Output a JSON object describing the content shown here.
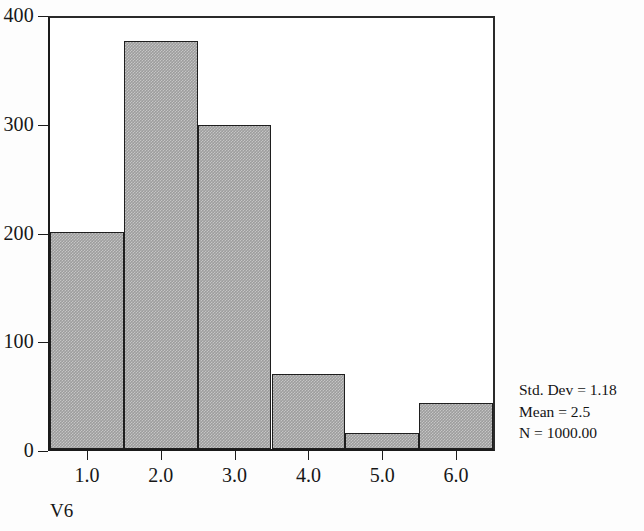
{
  "chart_data": {
    "type": "bar",
    "title": "",
    "subtitle": "",
    "xlabel": "V6",
    "ylabel": "",
    "categories": [
      "1.0",
      "2.0",
      "3.0",
      "4.0",
      "5.0",
      "6.0"
    ],
    "values": [
      200,
      375,
      298,
      69,
      15,
      42
    ],
    "x_tick_labels": [
      "1.0",
      "2.0",
      "3.0",
      "4.0",
      "5.0",
      "6.0"
    ],
    "y_tick_labels": [
      "0",
      "100",
      "200",
      "300",
      "400"
    ],
    "y_ticks": [
      0,
      100,
      200,
      300,
      400
    ],
    "ylim": [
      0,
      400
    ],
    "xlim": [
      0.5,
      6.5
    ],
    "grid": false,
    "legend": false,
    "legend_position": "none",
    "bar_fill_color": "#9d9d9d",
    "bar_edge_color": "#1e1e1e",
    "axis_color": "#1b1b1b",
    "annotations": [
      "Std. Dev = 1.18",
      "Mean = 2.5",
      "N = 1000.00"
    ]
  },
  "stats": {
    "std_dev_line": "Std. Dev = 1.18",
    "mean_line": "Mean = 2.5",
    "n_line": "N = 1000.00"
  }
}
